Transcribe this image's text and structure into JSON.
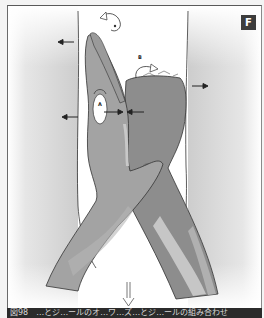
{
  "figure": {
    "badge": "F",
    "labels": {
      "a": "A",
      "b": "B",
      "b_top": "B"
    },
    "caption": "図98　…とジ…ールのオ…ワ…ズ…とジ…ールの組み合わせ",
    "colors": {
      "background_gray": "#cfcfcf",
      "center_white": "#ffffff",
      "skin_left_arm": "#9c9c9c",
      "skin_right_arm": "#8a8a8a",
      "highlight": "#c9c9c9",
      "badge_bg": "#3d3d3d",
      "caption_bg": "#2b2b2b"
    },
    "arrows": [
      {
        "id": "left-upper",
        "direction": "left"
      },
      {
        "id": "left-lower",
        "direction": "left"
      },
      {
        "id": "right-middle",
        "direction": "right"
      },
      {
        "id": "center-pinch-left",
        "direction": "right"
      },
      {
        "id": "center-pinch-right",
        "direction": "left"
      },
      {
        "id": "rotate-top",
        "direction": "counter-clockwise"
      },
      {
        "id": "rotate-b",
        "direction": "clockwise"
      },
      {
        "id": "down-outline",
        "direction": "down"
      }
    ]
  }
}
